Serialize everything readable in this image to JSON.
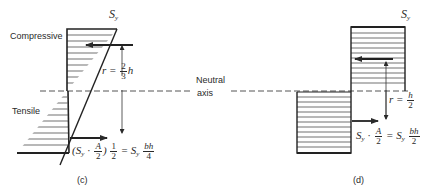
{
  "figure_c": {
    "caption": "(c)",
    "top_label": "S",
    "top_label_sub": "y",
    "compressive_label": "Compressive",
    "tensile_label": "Tensile",
    "lever_arm": {
      "lhs": "r =",
      "num": "2",
      "den": "3",
      "tail": "h"
    },
    "force_eq": {
      "open": "(S",
      "sub": "y",
      "dot": "·",
      "A_num": "A",
      "A_den": "2",
      "close": ")",
      "half_num": "1",
      "half_den": "2",
      "equals": "= S",
      "sub2": "y",
      "bh_num": "bh",
      "bh_den": "4"
    }
  },
  "figure_d": {
    "caption": "(d)",
    "top_label": "S",
    "top_label_sub": "y",
    "lever_arm": {
      "lhs": "r =",
      "num": "h",
      "den": "2"
    },
    "force_eq": {
      "s": "S",
      "sub": "y",
      "dot": "·",
      "A_num": "A",
      "A_den": "2",
      "equals": "= S",
      "sub2": "y",
      "bh_num": "bh",
      "bh_den": "2"
    }
  },
  "neutral_axis": {
    "line1": "Neutral",
    "line2": "axis"
  },
  "colors": {
    "ink": "#2a2a2a",
    "background": "#ffffff"
  }
}
